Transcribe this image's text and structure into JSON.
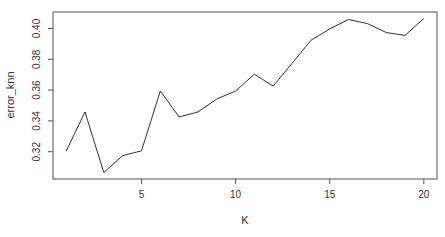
{
  "chart_data": {
    "type": "line",
    "title": "",
    "xlabel": "K",
    "ylabel": "error_knn",
    "x": [
      1,
      2,
      3,
      4,
      5,
      6,
      7,
      8,
      9,
      10,
      11,
      12,
      13,
      14,
      15,
      16,
      17,
      18,
      19,
      20
    ],
    "series": [
      {
        "name": "error_knn",
        "values": [
          0.3205,
          0.3458,
          0.3065,
          0.3174,
          0.3206,
          0.3594,
          0.3426,
          0.3458,
          0.3542,
          0.3594,
          0.3703,
          0.3626,
          0.3774,
          0.3923,
          0.3997,
          0.4058,
          0.4032,
          0.3974,
          0.3955,
          0.4065
        ]
      }
    ],
    "xlim": [
      0.3,
      20.7
    ],
    "ylim": [
      0.3023,
      0.4107
    ],
    "xticks": [
      5,
      10,
      15,
      20
    ],
    "xtick_labels": [
      "5",
      "10",
      "15",
      "20"
    ],
    "yticks": [
      0.32,
      0.34,
      0.36,
      0.38,
      0.4
    ],
    "ytick_labels": [
      "0.32",
      "0.34",
      "0.36",
      "0.38",
      "0.40"
    ],
    "grid": false,
    "legend": null,
    "line_color": "#333333"
  }
}
